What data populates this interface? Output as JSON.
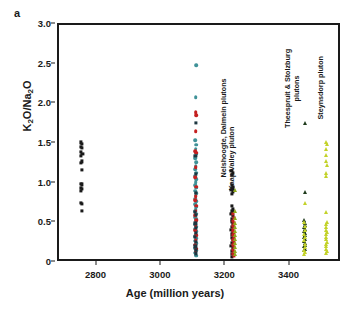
{
  "panel": {
    "label": "a"
  },
  "chart_data": {
    "type": "scatter",
    "title": "",
    "xlabel": "Age (million years)",
    "ylabel": "K2O/Na2O",
    "ylabel_html": "K<sub>2</sub>O/Na<sub>2</sub>O",
    "xlim": [
      2680,
      3560
    ],
    "ylim": [
      0,
      3.0
    ],
    "xticks": [
      2800,
      3000,
      3200,
      3400
    ],
    "xtick_labels": [
      "2800",
      "3000",
      "3200",
      "3400"
    ],
    "yticks": [
      0,
      0.5,
      1.0,
      1.5,
      2.0,
      2.5,
      3.0
    ],
    "ytick_labels": [
      "0",
      "0.5",
      "1.0",
      "1.5",
      "2.0",
      "2.5",
      "3.0"
    ],
    "grid": false,
    "legend": "none",
    "colors": {
      "black": "#1a1a1a",
      "teal": "#3f9298",
      "red": "#c42020",
      "dark_navy": "#1d3640",
      "dark_green": "#1f3b1c",
      "yellow_green": "#c3d22a",
      "olive": "#8fa81e"
    },
    "annotations": [
      {
        "text": "Nelshoogte, Dalmein plutons",
        "x": 3208,
        "rotation": -90
      },
      {
        "text": "Kaap Valley pluton",
        "x": 3228,
        "rotation": -90
      },
      {
        "text": "Theespruit & Stolzburg plutons",
        "x": 3438,
        "rotation": -90
      },
      {
        "text": "Steynsdorp pluton",
        "x": 3510,
        "rotation": -90
      }
    ],
    "series": [
      {
        "name": "cluster-2750-black-squares",
        "marker": "square",
        "color": "#1a1a1a",
        "points": [
          [
            2748,
            1.52
          ],
          [
            2752,
            1.5
          ],
          [
            2748,
            1.46
          ],
          [
            2752,
            1.45
          ],
          [
            2749,
            1.4
          ],
          [
            2753,
            1.38
          ],
          [
            2748,
            1.35
          ],
          [
            2751,
            1.28
          ],
          [
            2749,
            1.26
          ],
          [
            2750,
            1.17
          ],
          [
            2748,
            1.0
          ],
          [
            2752,
            0.99
          ],
          [
            2749,
            0.95
          ],
          [
            2752,
            0.93
          ],
          [
            2748,
            0.91
          ],
          [
            2749,
            0.76
          ],
          [
            2752,
            0.74
          ],
          [
            2750,
            0.66
          ]
        ]
      },
      {
        "name": "cluster-3105-teal",
        "marker": "circle",
        "color": "#3f9298",
        "points": [
          [
            3106,
            2.49
          ],
          [
            3105,
            2.09
          ],
          [
            3104,
            1.55
          ],
          [
            3107,
            1.49
          ],
          [
            3105,
            1.44
          ],
          [
            3106,
            1.38
          ],
          [
            3104,
            1.32
          ],
          [
            3107,
            1.27
          ],
          [
            3105,
            1.22
          ],
          [
            3103,
            1.18
          ],
          [
            3106,
            1.14
          ],
          [
            3104,
            1.1
          ],
          [
            3107,
            1.06
          ],
          [
            3105,
            1.02
          ],
          [
            3103,
            0.98
          ],
          [
            3106,
            0.95
          ],
          [
            3104,
            0.91
          ],
          [
            3107,
            0.88
          ],
          [
            3105,
            0.85
          ],
          [
            3103,
            0.81
          ],
          [
            3106,
            0.78
          ],
          [
            3104,
            0.74
          ],
          [
            3107,
            0.71
          ],
          [
            3105,
            0.68
          ],
          [
            3103,
            0.65
          ],
          [
            3106,
            0.62
          ],
          [
            3104,
            0.58
          ],
          [
            3107,
            0.55
          ],
          [
            3105,
            0.52
          ],
          [
            3103,
            0.49
          ],
          [
            3106,
            0.46
          ],
          [
            3104,
            0.43
          ],
          [
            3107,
            0.4
          ],
          [
            3105,
            0.37
          ],
          [
            3103,
            0.34
          ],
          [
            3106,
            0.31
          ],
          [
            3104,
            0.28
          ],
          [
            3107,
            0.25
          ],
          [
            3105,
            0.22
          ],
          [
            3103,
            0.19
          ],
          [
            3106,
            0.16
          ],
          [
            3104,
            0.13
          ],
          [
            3105,
            0.11
          ],
          [
            3106,
            0.09
          ]
        ]
      },
      {
        "name": "cluster-3105-red",
        "marker": "circle",
        "color": "#c42020",
        "points": [
          [
            3105,
            1.9
          ],
          [
            3106,
            1.86
          ],
          [
            3105,
            1.66
          ],
          [
            3104,
            1.41
          ],
          [
            3106,
            1.39
          ],
          [
            3105,
            1.21
          ],
          [
            3104,
            1.08
          ],
          [
            3106,
            0.96
          ],
          [
            3105,
            0.84
          ],
          [
            3104,
            0.79
          ],
          [
            3106,
            0.72
          ],
          [
            3105,
            0.66
          ],
          [
            3104,
            0.6
          ],
          [
            3106,
            0.54
          ],
          [
            3105,
            0.47
          ],
          [
            3104,
            0.41
          ],
          [
            3106,
            0.35
          ],
          [
            3105,
            0.29
          ],
          [
            3104,
            0.23
          ],
          [
            3106,
            0.18
          ],
          [
            3105,
            0.14
          ]
        ]
      },
      {
        "name": "cluster-3105-dark",
        "marker": "square",
        "color": "#1d3640",
        "points": [
          [
            3105,
            1.77
          ],
          [
            3104,
            1.35
          ],
          [
            3106,
            1.12
          ],
          [
            3105,
            0.88
          ],
          [
            3103,
            0.64
          ],
          [
            3106,
            0.61
          ],
          [
            3104,
            0.5
          ],
          [
            3105,
            0.44
          ],
          [
            3106,
            0.38
          ],
          [
            3103,
            0.33
          ],
          [
            3105,
            0.27
          ],
          [
            3104,
            0.21
          ],
          [
            3106,
            0.17
          ],
          [
            3105,
            0.12
          ]
        ]
      },
      {
        "name": "cluster-3220-black-squares",
        "marker": "square",
        "color": "#1a1a1a",
        "points": [
          [
            3216,
            1.16
          ],
          [
            3221,
            1.14
          ],
          [
            3218,
            1.11
          ],
          [
            3217,
            0.98
          ],
          [
            3222,
            0.96
          ],
          [
            3219,
            0.94
          ],
          [
            3216,
            0.92
          ],
          [
            3221,
            0.9
          ],
          [
            3218,
            0.87
          ],
          [
            3217,
            0.72
          ],
          [
            3222,
            0.68
          ],
          [
            3219,
            0.65
          ],
          [
            3216,
            0.62
          ],
          [
            3221,
            0.59
          ],
          [
            3218,
            0.55
          ],
          [
            3217,
            0.52
          ],
          [
            3222,
            0.49
          ],
          [
            3219,
            0.46
          ],
          [
            3216,
            0.42
          ],
          [
            3221,
            0.39
          ],
          [
            3218,
            0.36
          ],
          [
            3217,
            0.32
          ],
          [
            3222,
            0.29
          ],
          [
            3219,
            0.25
          ],
          [
            3216,
            0.22
          ],
          [
            3221,
            0.19
          ],
          [
            3218,
            0.15
          ],
          [
            3219,
            0.11
          ],
          [
            3217,
            0.08
          ]
        ]
      },
      {
        "name": "cluster-3222-red",
        "marker": "square",
        "color": "#c42020",
        "points": [
          [
            3222,
            0.62
          ],
          [
            3223,
            0.57
          ],
          [
            3221,
            0.53
          ],
          [
            3224,
            0.5
          ],
          [
            3222,
            0.47
          ],
          [
            3223,
            0.44
          ],
          [
            3221,
            0.41
          ],
          [
            3224,
            0.38
          ],
          [
            3222,
            0.35
          ],
          [
            3223,
            0.32
          ],
          [
            3221,
            0.29
          ],
          [
            3224,
            0.26
          ],
          [
            3222,
            0.23
          ],
          [
            3223,
            0.2
          ],
          [
            3221,
            0.17
          ],
          [
            3224,
            0.14
          ],
          [
            3222,
            0.11
          ],
          [
            3223,
            0.09
          ]
        ]
      },
      {
        "name": "cluster-3225-olive",
        "marker": "triangle",
        "color": "#8fa81e",
        "points": [
          [
            3227,
            0.92
          ],
          [
            3226,
            0.66
          ],
          [
            3228,
            0.57
          ],
          [
            3226,
            0.51
          ],
          [
            3227,
            0.45
          ],
          [
            3228,
            0.4
          ],
          [
            3226,
            0.35
          ],
          [
            3227,
            0.3
          ],
          [
            3228,
            0.25
          ],
          [
            3226,
            0.2
          ],
          [
            3227,
            0.15
          ],
          [
            3228,
            0.11
          ]
        ]
      },
      {
        "name": "cluster-3445-dark-green-triangles",
        "marker": "triangle",
        "color": "#1f3b1c",
        "points": [
          [
            3444,
            1.76
          ],
          [
            3444,
            0.9
          ],
          [
            3443,
            0.54
          ],
          [
            3446,
            0.51
          ],
          [
            3444,
            0.48
          ],
          [
            3442,
            0.45
          ],
          [
            3445,
            0.43
          ],
          [
            3443,
            0.4
          ],
          [
            3446,
            0.38
          ],
          [
            3444,
            0.35
          ],
          [
            3442,
            0.33
          ],
          [
            3445,
            0.3
          ],
          [
            3443,
            0.28
          ],
          [
            3446,
            0.25
          ],
          [
            3444,
            0.23
          ],
          [
            3442,
            0.21
          ],
          [
            3445,
            0.18
          ],
          [
            3443,
            0.16
          ]
        ]
      },
      {
        "name": "cluster-3445-yellow-green-triangles",
        "marker": "triangle",
        "color": "#c3d22a",
        "points": [
          [
            3445,
            0.76
          ],
          [
            3443,
            0.52
          ],
          [
            3446,
            0.47
          ],
          [
            3444,
            0.42
          ],
          [
            3442,
            0.37
          ],
          [
            3445,
            0.33
          ],
          [
            3443,
            0.29
          ],
          [
            3446,
            0.24
          ],
          [
            3444,
            0.2
          ],
          [
            3442,
            0.17
          ],
          [
            3445,
            0.14
          ],
          [
            3443,
            0.11
          ]
        ]
      },
      {
        "name": "cluster-3510-yellow-green-triangles",
        "marker": "triangle",
        "color": "#c3d22a",
        "points": [
          [
            3510,
            1.53
          ],
          [
            3512,
            1.5
          ],
          [
            3509,
            1.44
          ],
          [
            3511,
            1.36
          ],
          [
            3510,
            1.28
          ],
          [
            3512,
            1.24
          ],
          [
            3509,
            1.13
          ],
          [
            3511,
            1.1
          ],
          [
            3510,
            0.64
          ],
          [
            3512,
            0.52
          ],
          [
            3509,
            0.49
          ],
          [
            3511,
            0.45
          ],
          [
            3510,
            0.42
          ],
          [
            3512,
            0.39
          ],
          [
            3509,
            0.36
          ],
          [
            3511,
            0.33
          ],
          [
            3510,
            0.3
          ],
          [
            3512,
            0.27
          ],
          [
            3509,
            0.24
          ],
          [
            3511,
            0.21
          ],
          [
            3510,
            0.18
          ],
          [
            3512,
            0.15
          ],
          [
            3509,
            0.12
          ]
        ]
      }
    ]
  }
}
